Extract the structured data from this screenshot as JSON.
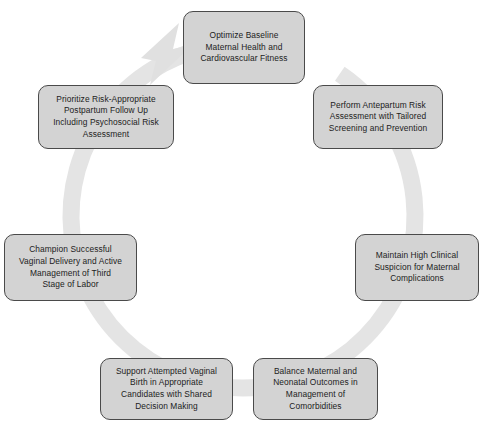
{
  "diagram": {
    "type": "cycle",
    "title": "",
    "direction": "clockwise",
    "ring": {
      "color": "#e2e2e2",
      "center_x": 243,
      "center_y": 216,
      "radius": 172,
      "thickness": 17,
      "arrowhead": "clockwise-arrow-top-left"
    },
    "node_fill": "#d3d3d3",
    "node_stroke": "#4a4a4a",
    "text_color": "#1c1c1c",
    "nodes": [
      {
        "id": "optimize-baseline",
        "order": 1,
        "label": "Optimize Baseline\nMaternal Health and\nCardiovascular Fitness"
      },
      {
        "id": "antepartum-risk-assessment",
        "order": 2,
        "label": "Perform Antepartum Risk\nAssessment with Tailored\nScreening and Prevention"
      },
      {
        "id": "clinical-suspicion",
        "order": 3,
        "label": "Maintain High Clinical\nSuspicion for Maternal\nComplications"
      },
      {
        "id": "balance-outcomes",
        "order": 4,
        "label": "Balance Maternal and\nNeonatal Outcomes in\nManagement of\nComorbidities"
      },
      {
        "id": "support-vaginal-birth",
        "order": 5,
        "label": "Support Attempted Vaginal\nBirth in Appropriate\nCandidates with Shared\nDecision Making"
      },
      {
        "id": "champion-vaginal-delivery",
        "order": 6,
        "label": "Champion Successful\nVaginal Delivery and Active\nManagement of Third\nStage of Labor"
      },
      {
        "id": "postpartum-follow-up",
        "order": 7,
        "label": "Prioritize Risk-Appropriate\nPostpartum Follow Up\nIncluding Psychosocial Risk\nAssessment"
      }
    ]
  }
}
